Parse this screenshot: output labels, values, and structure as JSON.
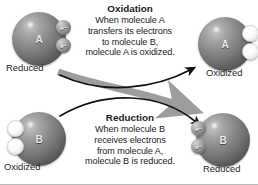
{
  "figure": {
    "background_color": "#ffffff"
  },
  "oxidation": {
    "heading": "Oxidation",
    "lines": [
      "When molecule A",
      "transfers its electrons",
      "to molecule B,",
      "molecule A is oxidized."
    ]
  },
  "reduction": {
    "heading": "Reduction",
    "lines": [
      "When molecule B",
      "receives electrons",
      "from molecule A,",
      "molecule B is reduced."
    ]
  },
  "molecules": {
    "a_reduced": {
      "letter": "A",
      "caption": "Reduced",
      "electron_label": "e",
      "electron_charge": "−",
      "electron_state": "filled",
      "electron_count": 2
    },
    "a_oxidized": {
      "letter": "A",
      "caption": "Oxidized",
      "electron_label": "",
      "electron_charge": "",
      "electron_state": "empty",
      "electron_count": 2
    },
    "b_oxidized": {
      "letter": "B",
      "caption": "Oxidized",
      "electron_label": "",
      "electron_charge": "",
      "electron_state": "empty",
      "electron_count": 2
    },
    "b_reduced": {
      "letter": "B",
      "caption": "Reduced",
      "electron_label": "e",
      "electron_charge": "−",
      "electron_state": "filled",
      "electron_count": 2
    }
  },
  "arrows": {
    "black_arrow_name": "molecule-b-to-a-arrow",
    "gray_arrow_name": "electron-transfer-arrow",
    "black_color": "#111111",
    "gray_color": "#9d9d9d"
  },
  "colors": {
    "text": "#1b1b1b",
    "sphere_dark": "#3c3c3c",
    "sphere_light": "#c8c8c8",
    "border": "#b9b9b9"
  }
}
